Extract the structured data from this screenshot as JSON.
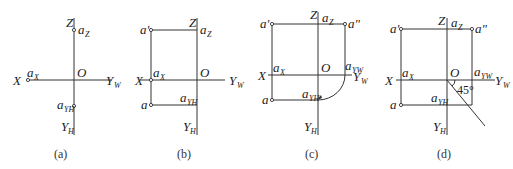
{
  "figure": {
    "panels": [
      {
        "caption": "(a)",
        "labels": {
          "X": "X",
          "Z": "Z",
          "O": "O",
          "Yw": "Y",
          "Yw_sub": "W",
          "Yh": "Y",
          "Yh_sub": "H",
          "az": "a",
          "az_sub": "Z",
          "ax": "a",
          "ax_sub": "X",
          "ayh": "a",
          "ayh_sub": "YH"
        }
      },
      {
        "caption": "(b)",
        "labels": {
          "X": "X",
          "Z": "Z",
          "O": "O",
          "Yw": "Y",
          "Yw_sub": "W",
          "Yh": "Y",
          "Yh_sub": "H",
          "a_prime": "a'",
          "a": "a",
          "az": "a",
          "az_sub": "Z",
          "ax": "a",
          "ax_sub": "X",
          "ayh": "a",
          "ayh_sub": "YH"
        }
      },
      {
        "caption": "(c)",
        "labels": {
          "X": "X",
          "Z": "Z",
          "O": "O",
          "Yw": "Y",
          "Yw_sub": "W",
          "Yh": "Y",
          "Yh_sub": "H",
          "a_prime": "a'",
          "a_dprime": "a\"",
          "a": "a",
          "az": "a",
          "az_sub": "Z",
          "ax": "a",
          "ax_sub": "X",
          "ayh": "a",
          "ayh_sub": "YH",
          "ayw": "a",
          "ayw_sub": "YW"
        }
      },
      {
        "caption": "(d)",
        "labels": {
          "X": "X",
          "Z": "Z",
          "O": "O",
          "Yw": "Y",
          "Yw_sub": "W",
          "Yh": "Y",
          "Yh_sub": "H",
          "a_prime": "a'",
          "a_dprime": "a\"",
          "a": "a",
          "az": "a",
          "az_sub": "Z",
          "ax": "a",
          "ax_sub": "X",
          "ayh": "a",
          "ayh_sub": "YH",
          "ayw": "a",
          "ayw_sub": "YW",
          "angle": "45°"
        }
      }
    ]
  }
}
